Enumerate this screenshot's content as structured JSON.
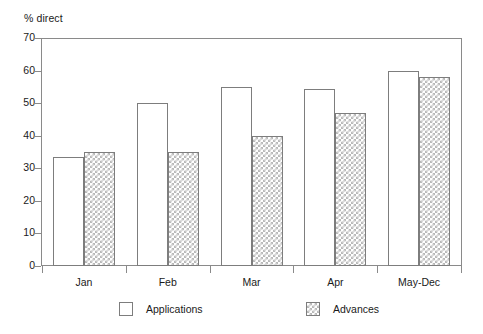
{
  "chart_data": {
    "type": "bar",
    "title": "",
    "ylabel": "% direct",
    "xlabel": "",
    "categories": [
      "Jan",
      "Feb",
      "Mar",
      "Apr",
      "May-Dec"
    ],
    "series": [
      {
        "name": "Applications",
        "values": [
          33.5,
          50,
          55,
          54.5,
          60
        ],
        "fill": "#ffffff",
        "pattern": "solid-white"
      },
      {
        "name": "Advances",
        "values": [
          35,
          35,
          40,
          47,
          58
        ],
        "fill": "#ffffff",
        "pattern": "cross-hatch"
      }
    ],
    "ylim": [
      0,
      70
    ],
    "yticks": [
      0,
      10,
      20,
      30,
      40,
      50,
      60,
      70
    ],
    "ytick_labels": [
      "0",
      "10",
      "20",
      "30",
      "40",
      "50",
      "60",
      "70"
    ],
    "grid": false,
    "legend_position": "bottom",
    "frame": "box",
    "axis_color": "#8a8a8a",
    "bar_edge_color": "#7d7d7d",
    "hatch_color": "#b9b9b9"
  },
  "legend": {
    "entries": [
      {
        "label": "Applications",
        "swatch": "legend-swatch-applications"
      },
      {
        "label": "Advances",
        "swatch": "legend-swatch-advances"
      }
    ]
  }
}
